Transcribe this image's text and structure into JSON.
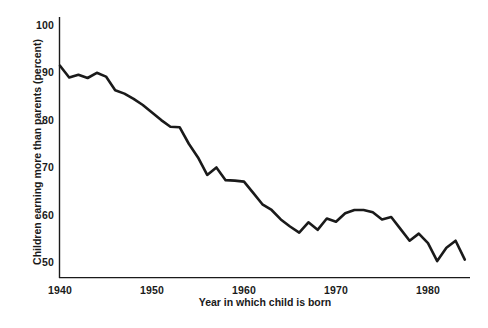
{
  "chart_data": {
    "type": "line",
    "title": "",
    "subtitle": "",
    "xlabel": "Year in which child is born",
    "ylabel": "Children earning more than parents (percent)",
    "xlim": [
      1940,
      1985
    ],
    "ylim": [
      45,
      103
    ],
    "xticks": [
      1940,
      1950,
      1960,
      1970,
      1980
    ],
    "xtick_labels": [
      "1940",
      "1950",
      "1960",
      "1970",
      "1980"
    ],
    "yticks": [
      50,
      60,
      70,
      80,
      90,
      100
    ],
    "ytick_labels": [
      "50",
      "60",
      "70",
      "80",
      "90",
      "100"
    ],
    "grid": false,
    "legend": null,
    "legend_position": "none",
    "line_color": "#1a1a1a",
    "line_width": 2.6,
    "series": [
      {
        "name": "Children earning more than parents",
        "x": [
          1940,
          1941,
          1942,
          1943,
          1944,
          1945,
          1946,
          1947,
          1948,
          1949,
          1950,
          1951,
          1952,
          1953,
          1954,
          1955,
          1956,
          1957,
          1958,
          1959,
          1960,
          1961,
          1962,
          1963,
          1964,
          1965,
          1966,
          1967,
          1968,
          1969,
          1970,
          1971,
          1972,
          1973,
          1974,
          1975,
          1976,
          1977,
          1978,
          1979,
          1980,
          1981,
          1982,
          1983,
          1984
        ],
        "values": [
          91.5,
          89.0,
          89.6,
          88.9,
          90.0,
          89.2,
          86.3,
          85.6,
          84.5,
          83.2,
          81.6,
          80.0,
          78.6,
          78.5,
          75.0,
          72.1,
          68.4,
          70.0,
          67.3,
          67.2,
          67.0,
          64.6,
          62.2,
          61.0,
          59.0,
          57.5,
          56.2,
          58.4,
          56.8,
          59.2,
          58.5,
          60.3,
          61.0,
          61.0,
          60.5,
          59.0,
          59.5,
          57.0,
          54.5,
          56.0,
          54.0,
          50.2,
          53.0,
          54.5,
          50.5
        ]
      }
    ]
  },
  "axes": {
    "y_title": "Children earning more than parents (percent)",
    "x_title": "Year in which child is born"
  }
}
